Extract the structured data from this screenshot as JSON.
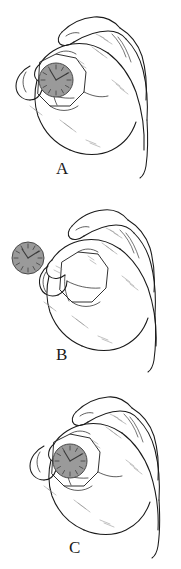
{
  "figure": {
    "background_color": "#ffffff",
    "ink_color": "#1a1a1a",
    "shading_color": "#8f8f8f",
    "disc_fill_color": "#9a9a9a",
    "disc_stroke_color": "#4a4a4a",
    "width": 181,
    "height": 569
  },
  "panels": [
    {
      "id": "a",
      "label": "A",
      "caption_letter": "A",
      "object": "clock-face-disc",
      "object_state": "held-between-thumb-and-index-finger",
      "object_center_x": 56,
      "object_center_y": 80,
      "object_radius": 17,
      "hand_pose": "precision-pinch-closed"
    },
    {
      "id": "b",
      "label": "B",
      "caption_letter": "B",
      "object": "clock-face-disc",
      "object_state": "released-displaced-left-of-hand",
      "object_center_x": 28,
      "object_center_y": 68,
      "object_radius": 16,
      "hand_pose": "precision-pinch-empty"
    },
    {
      "id": "c",
      "label": "C",
      "caption_letter": "C",
      "object": "clock-face-disc",
      "object_state": "held-between-thumb-and-index-finger",
      "object_center_x": 70,
      "object_center_y": 81,
      "object_radius": 17,
      "hand_pose": "precision-pinch-closed"
    }
  ],
  "disc": {
    "name": "clock-face-disc",
    "description": "gray circular disc with clock-style tick marks and two hands",
    "tick_count": 12,
    "hand_long_angle_deg": 35,
    "hand_short_angle_deg": 290
  }
}
